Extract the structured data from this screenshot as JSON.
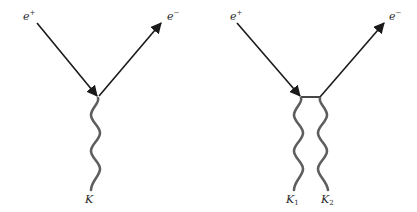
{
  "diagrams": [
    {
      "id": "single-boson",
      "labels": {
        "incoming_base": "e",
        "incoming_sup": "+",
        "outgoing_base": "e",
        "outgoing_sup": "−",
        "boson_base": "K",
        "boson_sub": ""
      }
    },
    {
      "id": "two-boson",
      "labels": {
        "incoming_base": "e",
        "incoming_sup": "+",
        "outgoing_base": "e",
        "outgoing_sup": "−",
        "boson1_base": "K",
        "boson1_sub": "1",
        "boson2_base": "K",
        "boson2_sub": "2"
      }
    }
  ],
  "colors": {
    "fermion_line": "#1a1a1a",
    "boson_line": "#5e5e5e",
    "background": "#ffffff"
  }
}
